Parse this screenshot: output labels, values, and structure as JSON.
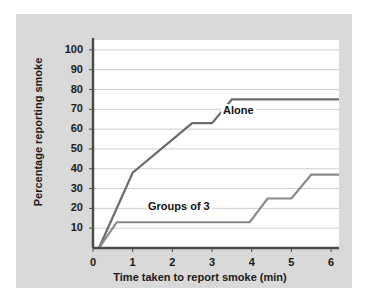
{
  "chart_data": {
    "type": "line",
    "title": "",
    "xlabel": "Time taken to report smoke (min)",
    "ylabel": "Percentage reporting smoke",
    "xlim": [
      0,
      6.2
    ],
    "ylim": [
      0,
      105
    ],
    "xticks": [
      "0",
      "1",
      "2",
      "3",
      "4",
      "5",
      "6"
    ],
    "yticks": [
      "10",
      "20",
      "30",
      "40",
      "50",
      "60",
      "70",
      "80",
      "90",
      "100"
    ],
    "grid": "horizontal",
    "legend_position": "inline-annotation",
    "line_color": "#6b6b6b",
    "axis_color": "#4a4a4a",
    "gridline_color": "#cfcfcf",
    "panel_color": "#d9d9d9",
    "plot_background": "#ffffff",
    "series": [
      {
        "name": "Alone",
        "label": "Alone",
        "color": "#6b6b6b",
        "points": [
          [
            0.15,
            0
          ],
          [
            1.0,
            38
          ],
          [
            2.5,
            63
          ],
          [
            3.0,
            63
          ],
          [
            3.5,
            75
          ],
          [
            6.2,
            75
          ]
        ]
      },
      {
        "name": "Groups of 3",
        "label": "Groups of 3",
        "color": "#8a8a8a",
        "points": [
          [
            0.15,
            0
          ],
          [
            0.6,
            13
          ],
          [
            3.95,
            13
          ],
          [
            4.4,
            25
          ],
          [
            5.0,
            25
          ],
          [
            5.5,
            37
          ],
          [
            6.2,
            37
          ]
        ]
      }
    ]
  }
}
